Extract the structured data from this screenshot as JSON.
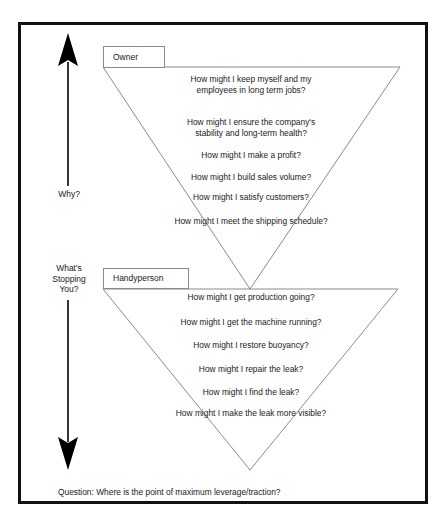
{
  "diagram": {
    "frame_color": "#111111",
    "triangle_stroke": "#8a8a8a",
    "arrow_color": "#000000"
  },
  "axis": {
    "up_arrow": {
      "icon": "up-arrow-icon",
      "label": "Why?"
    },
    "down_arrow": {
      "icon": "down-arrow-icon",
      "label": "What's\nStopping\nYou?"
    }
  },
  "funnels": [
    {
      "id": "owner",
      "tab_label": "Owner",
      "questions": [
        "How might I keep myself and my\nemployees in long term jobs?",
        "How might I ensure the company's\nstability and long-term health?",
        "How might I make a profit?",
        "How might I build sales volume?",
        "How might I satisfy customers?",
        "How might I meet the shipping schedule?"
      ]
    },
    {
      "id": "handyperson",
      "tab_label": "Handyperson",
      "questions": [
        "How might I get production going?",
        "How might I get the machine running?",
        "How might I restore buoyancy?",
        "How might I repair the leak?",
        "How might I find the leak?",
        "How might I make the leak more visible?"
      ]
    }
  ],
  "caption": {
    "text": "Question: Where is the point of maximum leverage/traction?"
  }
}
